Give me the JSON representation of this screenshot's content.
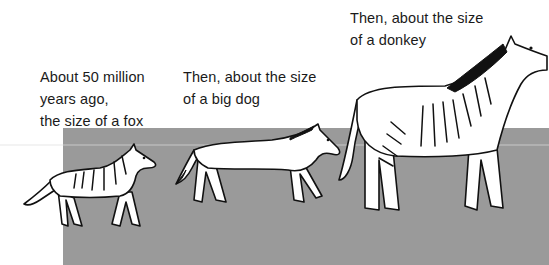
{
  "captions": [
    {
      "id": "eohippus",
      "text": "About 50 million\nyears ago,\nthe size of a fox"
    },
    {
      "id": "mesohippus",
      "text": "Then, about the size\nof a big dog"
    },
    {
      "id": "merychippus",
      "text": "Then, about the size\nof a donkey"
    }
  ],
  "illustrations": [
    {
      "name": "fox-sized-horse",
      "label": "fox-sized early horse"
    },
    {
      "name": "dog-sized-horse",
      "label": "dog-sized horse"
    },
    {
      "name": "donkey-sized-horse",
      "label": "donkey-sized striped horse"
    }
  ],
  "colors": {
    "background": "#ffffff",
    "ground": "#9a9a9a",
    "ink": "#111111"
  }
}
